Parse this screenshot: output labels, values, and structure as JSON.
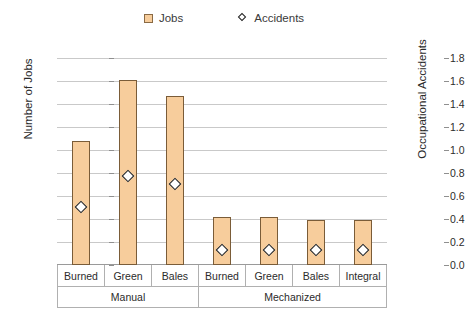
{
  "chart_data": {
    "type": "bar",
    "title": "",
    "categories": [
      "Burned",
      "Green",
      "Bales",
      "Burned",
      "Green",
      "Bales",
      "Integral"
    ],
    "groups": [
      {
        "label": "Manual",
        "span": 3
      },
      {
        "label": "Mechanized",
        "span": 4
      }
    ],
    "series": [
      {
        "name": "Jobs",
        "type": "bar",
        "axis": "left",
        "color": "#f7cd9c",
        "border_color": "#7a5c38",
        "marker": "square",
        "values": [
          10.8,
          16.1,
          14.7,
          4.2,
          4.2,
          3.9,
          3.9
        ]
      },
      {
        "name": "Accidents",
        "type": "scatter",
        "axis": "right",
        "color": "#ffffff",
        "border_color": "#151515",
        "marker": "diamond",
        "values": [
          0.54,
          0.81,
          0.74,
          0.17,
          0.17,
          0.17,
          0.17
        ]
      }
    ],
    "xlabel": "",
    "ylabel": "Number of Jobs",
    "y2label": "Occupational Accidents",
    "ylim": [
      0,
      18
    ],
    "y2lim": [
      0.0,
      1.8
    ],
    "yticks": [
      "0",
      "2",
      "4",
      "6",
      "8",
      "10",
      "12",
      "14",
      "16",
      "18"
    ],
    "y2ticks": [
      "0.0",
      "0.2",
      "0.4",
      "0.6",
      "0.8",
      "1.0",
      "1.2",
      "1.4",
      "1.6",
      "1.8"
    ],
    "grid": true,
    "legend_position": "top-center"
  },
  "legend": {
    "entries": [
      {
        "label": "Jobs",
        "marker": "square-swatch"
      },
      {
        "label": "Accidents",
        "marker": "diamond-marker"
      }
    ]
  }
}
